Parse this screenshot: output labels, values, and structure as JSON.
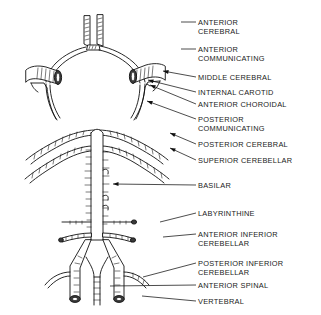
{
  "figure": {
    "background_color": "#ffffff",
    "ink_color": "#111111"
  },
  "labels": [
    {
      "id": "anterior-cerebral",
      "lines": [
        "ANTERIOR",
        "CEREBRAL"
      ],
      "text_x": 198,
      "text_y": 25,
      "leader": {
        "x1": 181,
        "y1": 22,
        "x2": 196,
        "y2": 22
      },
      "anchor": {
        "x": 97,
        "y": 22
      },
      "arrow": false
    },
    {
      "id": "anterior-communicating",
      "lines": [
        "ANTERIOR",
        "COMMUNICATING"
      ],
      "text_x": 198,
      "text_y": 52,
      "leader": {
        "x1": 181,
        "y1": 49,
        "x2": 196,
        "y2": 49
      },
      "anchor": {
        "x": 86,
        "y": 45
      },
      "arrow": false
    },
    {
      "id": "middle-cerebral",
      "lines": [
        "MIDDLE CEREBRAL"
      ],
      "text_x": 198,
      "text_y": 80,
      "leader": {
        "x1": 163,
        "y1": 71,
        "x2": 196,
        "y2": 77
      },
      "anchor": {
        "x": 163,
        "y": 71
      },
      "arrow": true
    },
    {
      "id": "internal-carotid",
      "lines": [
        "INTERNAL CAROTID"
      ],
      "text_x": 198,
      "text_y": 95,
      "leader": {
        "x1": 148,
        "y1": 80,
        "x2": 196,
        "y2": 92
      },
      "anchor": {
        "x": 148,
        "y": 80
      },
      "arrow": true
    },
    {
      "id": "anterior-choroidal",
      "lines": [
        "ANTERIOR CHOROIDAL"
      ],
      "text_x": 198,
      "text_y": 107,
      "leader": {
        "x1": 150,
        "y1": 85,
        "x2": 196,
        "y2": 104
      },
      "anchor": {
        "x": 150,
        "y": 85
      },
      "arrow": true
    },
    {
      "id": "posterior-communicating",
      "lines": [
        "POSTERIOR",
        "COMMUNICATING"
      ],
      "text_x": 198,
      "text_y": 122,
      "leader": {
        "x1": 147,
        "y1": 101,
        "x2": 196,
        "y2": 119
      },
      "anchor": {
        "x": 147,
        "y": 101
      },
      "arrow": true
    },
    {
      "id": "posterior-cerebral",
      "lines": [
        "POSTERIOR CEREBRAL"
      ],
      "text_x": 198,
      "text_y": 147,
      "leader": {
        "x1": 170,
        "y1": 133,
        "x2": 196,
        "y2": 144
      },
      "anchor": {
        "x": 170,
        "y": 133
      },
      "arrow": true
    },
    {
      "id": "superior-cerebellar",
      "lines": [
        "SUPERIOR CEREBELLAR"
      ],
      "text_x": 198,
      "text_y": 163,
      "leader": {
        "x1": 170,
        "y1": 148,
        "x2": 196,
        "y2": 160
      },
      "anchor": {
        "x": 170,
        "y": 148
      },
      "arrow": true
    },
    {
      "id": "basilar",
      "lines": [
        "BASILAR"
      ],
      "text_x": 198,
      "text_y": 188,
      "leader": {
        "x1": 113,
        "y1": 184,
        "x2": 196,
        "y2": 185
      },
      "anchor": {
        "x": 113,
        "y": 184
      },
      "arrow": true
    },
    {
      "id": "labyrinthine",
      "lines": [
        "LABYRINTHINE"
      ],
      "text_x": 198,
      "text_y": 216,
      "leader": {
        "x1": 160,
        "y1": 222,
        "x2": 196,
        "y2": 213
      },
      "anchor": {
        "x": 160,
        "y": 222
      },
      "arrow": false
    },
    {
      "id": "anterior-inferior-cerebellar",
      "lines": [
        "ANTERIOR INFERIOR",
        "CEREBELLAR"
      ],
      "text_x": 198,
      "text_y": 237,
      "leader": {
        "x1": 163,
        "y1": 237,
        "x2": 196,
        "y2": 234
      },
      "anchor": {
        "x": 163,
        "y": 237
      },
      "arrow": false
    },
    {
      "id": "posterior-inferior-cerebellar",
      "lines": [
        "POSTERIOR INFERIOR",
        "CEREBELLAR"
      ],
      "text_x": 198,
      "text_y": 266,
      "leader": {
        "x1": 143,
        "y1": 277,
        "x2": 196,
        "y2": 263
      },
      "anchor": {
        "x": 143,
        "y": 277
      },
      "arrow": false
    },
    {
      "id": "anterior-spinal",
      "lines": [
        "ANTERIOR SPINAL"
      ],
      "text_x": 198,
      "text_y": 288,
      "leader": {
        "x1": 110,
        "y1": 286,
        "x2": 196,
        "y2": 285
      },
      "anchor": {
        "x": 110,
        "y": 286
      },
      "arrow": false
    },
    {
      "id": "vertebral",
      "lines": [
        "VERTEBRAL"
      ],
      "text_x": 198,
      "text_y": 304,
      "leader": {
        "x1": 142,
        "y1": 296,
        "x2": 196,
        "y2": 301
      },
      "anchor": {
        "x": 142,
        "y": 296
      },
      "arrow": false
    }
  ]
}
